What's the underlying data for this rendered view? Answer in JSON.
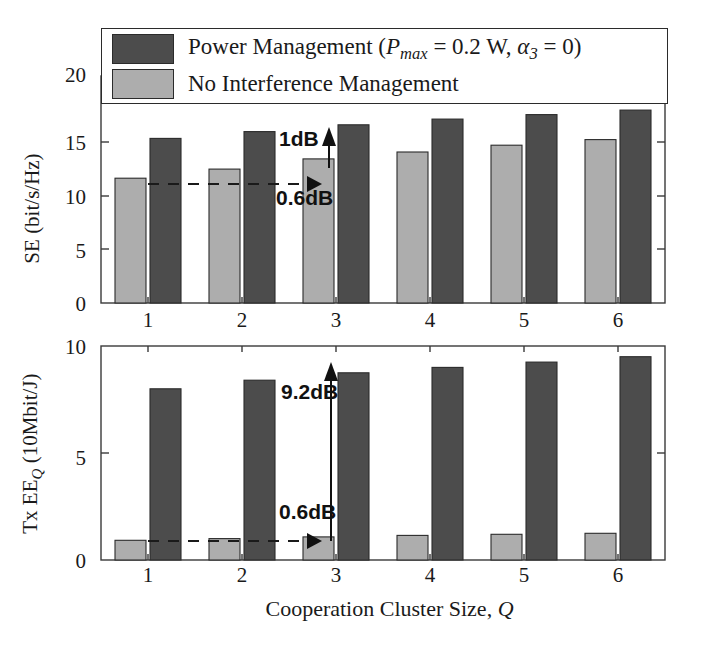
{
  "legend": {
    "items": [
      {
        "key": "power-management",
        "label_prefix": "Power Management (",
        "label_var1": "P",
        "label_var1_sub": "max",
        "label_mid": " = 0.2 W, ",
        "label_var2": "α",
        "label_var2_sub": "3",
        "label_suffix": " = 0)",
        "color": "#4c4c4c"
      },
      {
        "key": "no-interference-management",
        "label_prefix": "No Interference Management",
        "label_var1": "",
        "label_var1_sub": "",
        "label_mid": "",
        "label_var2": "",
        "label_var2_sub": "",
        "label_suffix": "",
        "color": "#adadad"
      }
    ]
  },
  "colors": {
    "dark_bar": "#4c4c4c",
    "light_bar": "#adadad",
    "bar_edge": "#2b2b2b",
    "axis": "#3a3a3a",
    "annotation": "#111111"
  },
  "chart_data": [
    {
      "id": "spectral-efficiency",
      "type": "bar",
      "title": "",
      "xlabel": "",
      "ylabel": "SE (bit/s/Hz)",
      "ylabel_parts": {
        "prefix": "SE (bit/s/Hz)"
      },
      "categories": [
        "1",
        "2",
        "3",
        "4",
        "5",
        "6"
      ],
      "ylim": [
        0,
        20
      ],
      "yticks": [
        0,
        5,
        10,
        15,
        20
      ],
      "ytick_labels": [
        "0",
        "5",
        "10",
        "15",
        "20"
      ],
      "grid": false,
      "legend_position": "top",
      "series": [
        {
          "name": "No Interference Management",
          "color": "#adadad",
          "values": [
            11.0,
            11.8,
            12.7,
            13.3,
            13.9,
            14.4
          ]
        },
        {
          "name": "Power Management",
          "color": "#4c4c4c",
          "values": [
            14.5,
            15.1,
            15.7,
            16.2,
            16.6,
            17.0
          ]
        }
      ],
      "annotations": [
        {
          "name": "gain-1db",
          "text": "1dB",
          "kind": "vertical-arrow",
          "at_category": "3"
        },
        {
          "name": "gain-0p6db",
          "text": "0.6dB",
          "kind": "horizontal-dashed-arrow",
          "at_category": "3"
        }
      ]
    },
    {
      "id": "transmit-energy-efficiency",
      "type": "bar",
      "title": "",
      "xlabel": "Cooperation Cluster Size, Q",
      "ylabel": "Tx EE_Q (10Mbit/J)",
      "ylabel_parts": {
        "prefix": "Tx EE",
        "sub": "Q",
        "suffix": " (10Mbit/J)"
      },
      "categories": [
        "1",
        "2",
        "3",
        "4",
        "5",
        "6"
      ],
      "ylim": [
        0,
        10
      ],
      "yticks": [
        0,
        5,
        10
      ],
      "ytick_labels": [
        "0",
        "5",
        "10"
      ],
      "grid": false,
      "legend_position": "none",
      "series": [
        {
          "name": "No Interference Management",
          "color": "#adadad",
          "values": [
            0.92,
            1.0,
            1.08,
            1.15,
            1.2,
            1.25
          ]
        },
        {
          "name": "Power Management",
          "color": "#4c4c4c",
          "values": [
            8.0,
            8.4,
            8.75,
            9.0,
            9.25,
            9.5
          ]
        }
      ],
      "annotations": [
        {
          "name": "gain-9p2db",
          "text": "9.2dB",
          "kind": "vertical-arrow",
          "at_category": "3"
        },
        {
          "name": "gain-0p6db",
          "text": "0.6dB",
          "kind": "horizontal-dashed-arrow",
          "at_category": "3"
        }
      ]
    }
  ],
  "axes": {
    "xlabel": "Cooperation Cluster Size, Q",
    "xlabel_text": "Cooperation Cluster Size, ",
    "xlabel_var": "Q",
    "xtick_labels": [
      "1",
      "2",
      "3",
      "4",
      "5",
      "6"
    ],
    "top": {
      "ylabel_text": "SE (bit/s/Hz)",
      "ytick_labels": [
        "0",
        "5",
        "10",
        "15",
        "20"
      ]
    },
    "bottom": {
      "ylabel_prefix": "Tx EE",
      "ylabel_sub": "Q",
      "ylabel_suffix": " (10Mbit/J)",
      "ytick_labels": [
        "0",
        "5",
        "10"
      ]
    }
  },
  "annotations": {
    "top_vertical": "1dB",
    "top_horizontal": "0.6dB",
    "bottom_vertical": "9.2dB",
    "bottom_horizontal": "0.6dB"
  }
}
